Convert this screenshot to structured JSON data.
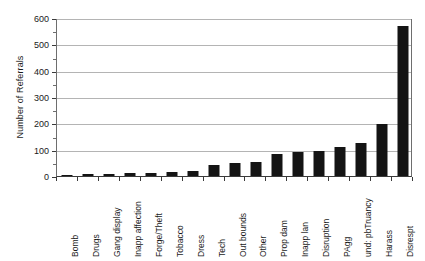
{
  "chart_data": {
    "type": "bar",
    "title": "",
    "xlabel": "",
    "ylabel": "Number of Referrals",
    "ylim": [
      0,
      600
    ],
    "ytick_interval": 100,
    "yminor_tick_interval": 50,
    "grid": true,
    "legend": "none",
    "bar_color": "#141414",
    "categories": [
      "Bomb",
      "Drugs",
      "Gang display",
      "Inapp affection",
      "Forge/Theft",
      "Tobacco",
      "Dress",
      "Tech",
      "Out bounds",
      "Other",
      "Prop dam",
      "Inapp lan",
      "Disruption",
      "PAgg",
      "und: pbTruancy",
      "Harass",
      "Disrespt"
    ],
    "values": [
      3,
      8,
      8,
      10,
      10,
      15,
      18,
      42,
      50,
      52,
      85,
      90,
      95,
      110,
      125,
      198,
      570
    ],
    "ytick_labels": [
      "0",
      "100",
      "200",
      "300",
      "400",
      "500",
      "600"
    ],
    "ytick_values": [
      0,
      100,
      200,
      300,
      400,
      500,
      600
    ]
  }
}
